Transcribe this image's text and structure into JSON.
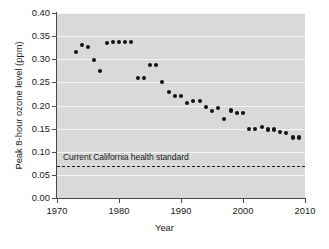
{
  "chart_data": {
    "type": "scatter",
    "title": "",
    "xlabel": "Year",
    "ylabel": "Peak 8-hour ozone level (ppm)",
    "xlim": [
      1970,
      2010
    ],
    "ylim": [
      0.0,
      0.4
    ],
    "xticks": [
      1970,
      1980,
      1990,
      2000,
      2010
    ],
    "xtick_labels": [
      "1970",
      "1980",
      "1990",
      "2000",
      "2010"
    ],
    "yticks": [
      0.0,
      0.05,
      0.1,
      0.15,
      0.2,
      0.25,
      0.3,
      0.35,
      0.4
    ],
    "ytick_labels": [
      "0.00",
      "0.05",
      "0.10",
      "0.15",
      "0.20",
      "0.25",
      "0.30",
      "0.35",
      "0.40"
    ],
    "grid": "horizontal-white-gridlines",
    "legend": "none",
    "plot_background": "#d9d9d9",
    "marker_color": "#121212",
    "series": [
      {
        "name": "Peak 8-hour ozone level",
        "x": [
          1973,
          1974,
          1975,
          1976,
          1977,
          1978,
          1979,
          1980,
          1981,
          1982,
          1983,
          1984,
          1985,
          1986,
          1987,
          1988,
          1989,
          1990,
          1991,
          1992,
          1993,
          1994,
          1995,
          1996,
          1997,
          1998,
          1999,
          2000,
          2001,
          2002,
          2003,
          2004,
          2005,
          2006,
          2007,
          2008,
          2009
        ],
        "y": [
          0.315,
          0.33,
          0.326,
          0.299,
          0.274,
          0.336,
          0.337,
          0.337,
          0.337,
          0.337,
          0.259,
          0.259,
          0.288,
          0.288,
          0.251,
          0.229,
          0.221,
          0.221,
          0.206,
          0.209,
          0.209,
          0.196,
          0.188,
          0.194,
          0.171,
          0.189,
          0.184,
          0.184,
          0.15,
          0.15,
          0.153,
          0.148,
          0.148,
          0.143,
          0.14,
          0.131,
          0.131
        ]
      }
    ],
    "annotations": [
      {
        "type": "hline",
        "name": "california-health-standard",
        "value": 0.07,
        "style": "dashed",
        "label": "Current California health standard"
      }
    ]
  }
}
